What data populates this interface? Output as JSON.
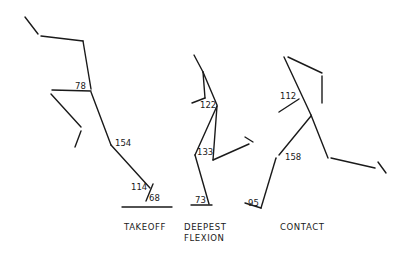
{
  "figures": [
    {
      "id": "takeoff",
      "caption": [
        "TAKEOFF"
      ],
      "caption_pos": {
        "x": 124,
        "y": 222
      },
      "segments": [
        [
          25,
          17,
          38,
          34
        ],
        [
          41,
          36,
          83,
          41
        ],
        [
          83,
          41,
          91,
          89
        ],
        [
          52,
          90,
          91,
          91
        ],
        [
          51,
          94,
          81,
          127
        ],
        [
          81,
          131,
          75,
          147
        ],
        [
          91,
          92,
          111,
          145
        ],
        [
          111,
          145,
          150,
          188
        ],
        [
          153,
          184,
          146,
          201
        ],
        [
          122,
          207,
          172,
          207
        ]
      ],
      "angles": [
        {
          "label": "78",
          "x": 75,
          "y": 89
        },
        {
          "label": "154",
          "x": 115,
          "y": 146
        },
        {
          "label": "114",
          "x": 131,
          "y": 190
        },
        {
          "label": "68",
          "x": 149,
          "y": 201
        }
      ]
    },
    {
      "id": "deepest-flexion",
      "caption": [
        "DEEPEST",
        "FLEXION"
      ],
      "caption_pos": {
        "x": 184,
        "y": 222
      },
      "segments": [
        [
          194,
          55,
          203,
          72
        ],
        [
          203,
          72,
          217,
          105
        ],
        [
          203,
          72,
          205,
          98
        ],
        [
          205,
          98,
          192,
          103
        ],
        [
          217,
          106,
          195,
          155
        ],
        [
          195,
          155,
          209,
          204
        ],
        [
          217,
          106,
          213,
          160
        ],
        [
          213,
          160,
          249,
          144
        ],
        [
          245,
          137,
          253,
          142
        ],
        [
          191,
          205,
          212,
          205
        ]
      ],
      "angles": [
        {
          "label": "122",
          "x": 200,
          "y": 108
        },
        {
          "label": "133",
          "x": 197,
          "y": 155
        },
        {
          "label": "73",
          "x": 195,
          "y": 203
        }
      ]
    },
    {
      "id": "contact",
      "caption": [
        "CONTACT"
      ],
      "caption_pos": {
        "x": 280,
        "y": 222
      },
      "segments": [
        [
          284,
          57,
          311,
          115
        ],
        [
          288,
          57,
          322,
          73
        ],
        [
          322,
          76,
          322,
          103
        ],
        [
          279,
          112,
          299,
          99
        ],
        [
          311,
          115,
          328,
          158
        ],
        [
          331,
          158,
          375,
          168
        ],
        [
          378,
          162,
          386,
          173
        ],
        [
          311,
          116,
          279,
          155
        ],
        [
          276,
          158,
          261,
          208
        ],
        [
          245,
          203,
          261,
          208
        ]
      ],
      "angles": [
        {
          "label": "112",
          "x": 280,
          "y": 99
        },
        {
          "label": "158",
          "x": 285,
          "y": 160
        },
        {
          "label": "95",
          "x": 248,
          "y": 206
        }
      ]
    }
  ]
}
